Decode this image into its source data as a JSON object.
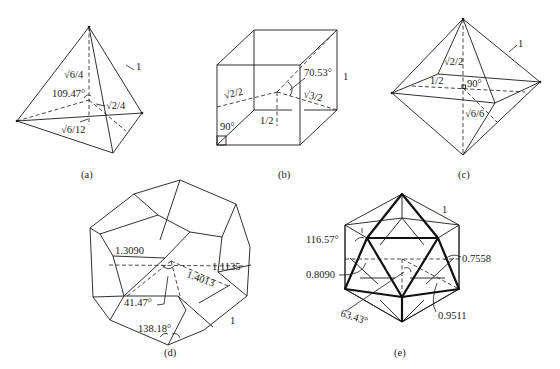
{
  "figure": {
    "panels": [
      {
        "id": "a",
        "caption": "(a)",
        "solid": "tetrahedron",
        "labels": {
          "edge": "1",
          "height": "√6/4",
          "angle": "109.47°",
          "center_to_edge": "√2/4",
          "center_to_face": "√6/12"
        }
      },
      {
        "id": "b",
        "caption": "(b)",
        "solid": "cube",
        "labels": {
          "edge": "1",
          "face_diag_half": "√2/2",
          "angle": "70.53°",
          "body_diag_half": "√3/2",
          "right_angle": "90°",
          "half_edge": "1/2"
        }
      },
      {
        "id": "c",
        "caption": "(c)",
        "solid": "octahedron",
        "labels": {
          "edge": "1",
          "vertex_radius": "√2/2",
          "half_edge": "1/2",
          "right_angle": "90°",
          "face_radius": "√6/6"
        }
      },
      {
        "id": "d",
        "caption": "(d)",
        "solid": "dodecahedron",
        "labels": {
          "edge": "1",
          "r1": "1.3090",
          "r2": "1.1135",
          "r3": "1.4013",
          "angle1": "41.47°",
          "dihedral": "138.18°"
        }
      },
      {
        "id": "e",
        "caption": "(e)",
        "solid": "icosahedron",
        "labels": {
          "edge": "1",
          "dihedral": "116.57°",
          "r1": "0.8090",
          "r2": "0.7558",
          "angle": "63.43°",
          "r3": "0.9511"
        }
      }
    ]
  }
}
